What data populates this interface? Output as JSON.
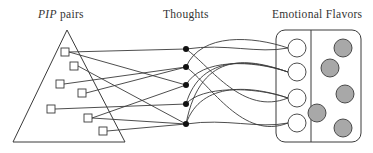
{
  "labels": {
    "pip_italic": "PIP",
    "pip_rest": " pairs",
    "thoughts": "Thoughts",
    "emotional_flavors": "Emotional Flavors"
  },
  "colors": {
    "stroke": "#3a3a3a",
    "gray_fill": "#a8a8a8",
    "dot": "#111111"
  },
  "diagram": {
    "triangle": {
      "apex": [
        67,
        30
      ],
      "base_left": [
        13,
        142
      ],
      "base_right": [
        125,
        142
      ]
    },
    "pip_pairs": [
      {
        "id": "S1",
        "x": 65,
        "y": 52
      },
      {
        "id": "S2",
        "x": 74,
        "y": 66
      },
      {
        "id": "S3",
        "x": 60,
        "y": 84
      },
      {
        "id": "S4",
        "x": 82,
        "y": 93
      },
      {
        "id": "S5",
        "x": 51,
        "y": 109
      },
      {
        "id": "S6",
        "x": 88,
        "y": 118
      },
      {
        "id": "S7",
        "x": 103,
        "y": 131
      }
    ],
    "thoughts": [
      {
        "id": "T1",
        "x": 186,
        "y": 49
      },
      {
        "id": "T2",
        "x": 186,
        "y": 67
      },
      {
        "id": "T3",
        "x": 186,
        "y": 85
      },
      {
        "id": "T4",
        "x": 186,
        "y": 104
      },
      {
        "id": "T5",
        "x": 186,
        "y": 124
      }
    ],
    "pair_to_thought": [
      [
        "S1",
        "T1"
      ],
      [
        "S1",
        "T3"
      ],
      [
        "S2",
        "T5"
      ],
      [
        "S3",
        "T2"
      ],
      [
        "S4",
        "T2"
      ],
      [
        "S5",
        "T4"
      ],
      [
        "S6",
        "T3"
      ],
      [
        "S6",
        "T5"
      ],
      [
        "S7",
        "T5"
      ]
    ],
    "flavor_box": {
      "x": 276,
      "y": 30,
      "width": 85,
      "height": 112,
      "radius": 9,
      "divider_x": 311
    },
    "white_flavors": [
      {
        "id": "C1",
        "x": 297,
        "y": 48
      },
      {
        "id": "C2",
        "x": 297,
        "y": 72
      },
      {
        "id": "C3",
        "x": 297,
        "y": 98
      },
      {
        "id": "C4",
        "x": 297,
        "y": 123
      }
    ],
    "gray_flavors": [
      {
        "x": 343,
        "y": 48
      },
      {
        "x": 330,
        "y": 68
      },
      {
        "x": 345,
        "y": 94
      },
      {
        "x": 317,
        "y": 113
      },
      {
        "x": 343,
        "y": 128
      }
    ],
    "thought_to_flavor": [
      [
        "T1",
        "C1"
      ],
      [
        "T1",
        "C3"
      ],
      [
        "T2",
        "C1"
      ],
      [
        "T2",
        "C4"
      ],
      [
        "T3",
        "C2"
      ],
      [
        "T4",
        "C2"
      ],
      [
        "T4",
        "C3"
      ],
      [
        "T5",
        "C2"
      ],
      [
        "T5",
        "C3"
      ],
      [
        "T5",
        "C4"
      ]
    ]
  }
}
